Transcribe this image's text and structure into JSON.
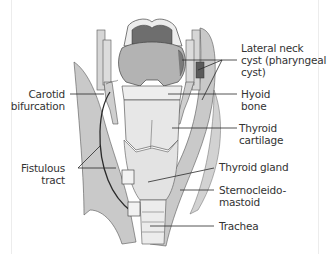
{
  "diagram": {
    "colors": {
      "background": "#ffffff",
      "muscle": "#c8c8c8",
      "cartilage": "#e6e6e6",
      "tongue_base": "#b0b0b0",
      "dark_region": "#6e6e6e",
      "cyst": "#5a5a5a",
      "line": "#2a2a2a",
      "label": "#333333"
    },
    "labels": {
      "lateral_neck_cyst": "Lateral neck\ncyst (pharyngeal\ncyst)",
      "hyoid_bone": "Hyoid\nbone",
      "thyroid_cartilage": "Thyroid\ncartilage",
      "thyroid_gland": "Thyroid gland",
      "sternocleidomastoid": "Sternocleido-\nmastoid",
      "trachea": "Trachea",
      "carotid_bifurcation": "Carotid\nbifurcation",
      "fistulous_tract": "Fistulous\ntract"
    }
  }
}
